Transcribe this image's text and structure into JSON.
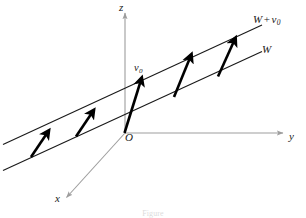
{
  "figure": {
    "caption": "Figure",
    "background_color": "#ffffff",
    "width": 306,
    "height": 218
  },
  "colors": {
    "axis": "#9d9d9d",
    "line": "#1a1a1a",
    "vector": "#000000",
    "label": "#1a1a1a",
    "caption": "#9a9a9a"
  },
  "axes": [
    {
      "name": "z-axis",
      "label": "z",
      "orientation": "vertical-up",
      "from": [
        125,
        133
      ],
      "to": [
        125,
        12
      ],
      "arrowhead": true,
      "color": "#9d9d9d"
    },
    {
      "name": "y-axis",
      "label": "y",
      "orientation": "horizontal-right",
      "from": [
        125,
        133
      ],
      "to": [
        285,
        133
      ],
      "arrowhead": true,
      "color": "#9d9d9d"
    },
    {
      "name": "x-axis",
      "label": "x",
      "orientation": "diagonal-down-left",
      "from": [
        125,
        133
      ],
      "to": [
        67,
        198
      ],
      "arrowhead": true,
      "color": "#9d9d9d"
    }
  ],
  "origin": {
    "label": "O",
    "position": [
      125,
      133
    ]
  },
  "lines": [
    {
      "name": "line-W",
      "label": "W",
      "description": "subspace W passing through the origin",
      "from": [
        3,
        170
      ],
      "to": [
        262,
        52
      ],
      "color": "#1a1a1a",
      "width": 1.1
    },
    {
      "name": "line-W-plus-v0",
      "label": "W + v0",
      "description": "affine subspace W + v0, translate of W by v0",
      "from": [
        3,
        144
      ],
      "to": [
        262,
        25
      ],
      "color": "#1a1a1a",
      "width": 1.1
    }
  ],
  "vectors": [
    {
      "name": "vector-1",
      "label": "",
      "from": [
        32,
        163
      ],
      "to": [
        48,
        131
      ]
    },
    {
      "name": "vector-2",
      "label": "",
      "from": [
        77,
        143
      ],
      "to": [
        93,
        111
      ]
    },
    {
      "name": "vector-3",
      "label": "v0",
      "from": [
        125,
        133
      ],
      "to": [
        141,
        78
      ]
    },
    {
      "name": "vector-4",
      "label": "",
      "from": [
        175,
        102
      ],
      "to": [
        191,
        55
      ]
    },
    {
      "name": "vector-5",
      "label": "",
      "from": [
        219,
        82
      ],
      "to": [
        235,
        38
      ]
    }
  ],
  "labels": {
    "z": "z",
    "y": "y",
    "x": "x",
    "origin": "O",
    "v0_base": "v",
    "v0_sub": "0",
    "w": "W",
    "w_plus": "W",
    "w_operator": "+",
    "w_plus_v_base": "v",
    "w_plus_v_sub": "0"
  },
  "caption_text": "Figure"
}
